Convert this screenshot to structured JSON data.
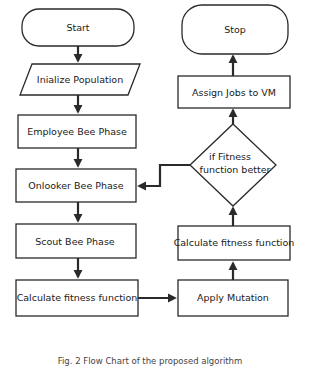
{
  "diagram": {
    "type": "flowchart",
    "title": "",
    "nodes": [
      {
        "id": "start",
        "shape": "terminator",
        "label": "Start"
      },
      {
        "id": "init",
        "shape": "parallelogram",
        "label": "Inialize Population"
      },
      {
        "id": "employee",
        "shape": "rectangle",
        "label": "Employee Bee Phase"
      },
      {
        "id": "onlooker",
        "shape": "rectangle",
        "label": "Onlooker Bee Phase"
      },
      {
        "id": "scout",
        "shape": "rectangle",
        "label": "Scout Bee Phase"
      },
      {
        "id": "calc1",
        "shape": "rectangle",
        "label": "Calculate fitness function"
      },
      {
        "id": "mutation",
        "shape": "rectangle",
        "label": "Apply Mutation"
      },
      {
        "id": "calc2",
        "shape": "rectangle",
        "label": "Calculate fitness function"
      },
      {
        "id": "decision",
        "shape": "diamond",
        "label_line1": "if Fitness",
        "label_line2": "function better"
      },
      {
        "id": "assign",
        "shape": "rectangle",
        "label": "Assign Jobs to VM"
      },
      {
        "id": "stop",
        "shape": "terminator",
        "label": "Stop"
      }
    ],
    "edges": [
      {
        "from": "start",
        "to": "init"
      },
      {
        "from": "init",
        "to": "employee"
      },
      {
        "from": "employee",
        "to": "onlooker"
      },
      {
        "from": "onlooker",
        "to": "scout"
      },
      {
        "from": "scout",
        "to": "calc1"
      },
      {
        "from": "calc1",
        "to": "mutation"
      },
      {
        "from": "mutation",
        "to": "calc2"
      },
      {
        "from": "calc2",
        "to": "decision"
      },
      {
        "from": "decision",
        "to": "assign",
        "label": ""
      },
      {
        "from": "decision",
        "to": "onlooker",
        "label": ""
      },
      {
        "from": "assign",
        "to": "stop"
      }
    ],
    "caption": "Fig. 2 Flow Chart of the proposed algorithm"
  },
  "colors": {
    "stroke": "#2a2a2a",
    "fill": "#ffffff",
    "text": "#1a1a1a"
  }
}
